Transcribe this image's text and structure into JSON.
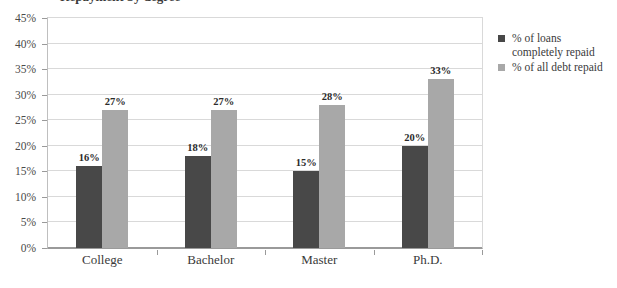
{
  "chart_data": {
    "type": "bar",
    "title": "",
    "xlabel": "",
    "ylabel": "",
    "categories": [
      "College",
      "Bachelor",
      "Master",
      "Ph.D."
    ],
    "series": [
      {
        "name": "% of loans completely repaid",
        "color": "#484848",
        "values": [
          16,
          18,
          15,
          20
        ],
        "labels": [
          "16%",
          "18%",
          "15%",
          "20%"
        ]
      },
      {
        "name": "% of all debt repaid",
        "color": "#a8a8a8",
        "values": [
          27,
          27,
          28,
          33
        ],
        "labels": [
          "27%",
          "27%",
          "28%",
          "33%"
        ]
      }
    ],
    "ylim": [
      0,
      45
    ],
    "ytick_values": [
      0,
      5,
      10,
      15,
      20,
      25,
      30,
      35,
      40,
      45
    ],
    "ytick_labels": [
      "0%",
      "5%",
      "10%",
      "15%",
      "20%",
      "25%",
      "30%",
      "35%",
      "40%",
      "45%"
    ],
    "grid": true,
    "legend_position": "right"
  },
  "legend": {
    "entries": [
      {
        "label": "% of loans completely repaid"
      },
      {
        "label": "% of all debt repaid"
      }
    ]
  },
  "title_sliver": {
    "text": "Repayment by degree"
  }
}
